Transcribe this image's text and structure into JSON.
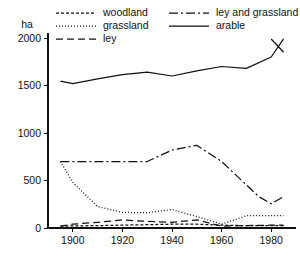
{
  "chart_data": {
    "type": "line",
    "title": "",
    "xlabel": "",
    "ylabel": "ha",
    "unit_label": "ha",
    "xlim": [
      1890,
      1990
    ],
    "ylim": [
      0,
      2100
    ],
    "yticks": [
      0,
      500,
      1000,
      1500,
      2000
    ],
    "xticks": [
      1900,
      1920,
      1940,
      1960,
      1980
    ],
    "grid": false,
    "legend_position": "top",
    "colors": {
      "line": "#111111",
      "background": "#ffffff"
    },
    "series": [
      {
        "name": "woodland",
        "dash": "3,2",
        "x": [
          1895,
          1910,
          1920,
          1930,
          1940,
          1950,
          1960,
          1970,
          1980,
          1985
        ],
        "values": [
          20,
          25,
          30,
          35,
          40,
          40,
          30,
          25,
          25,
          25
        ]
      },
      {
        "name": "grassland",
        "dash": "1,2",
        "x": [
          1895,
          1900,
          1910,
          1920,
          1930,
          1940,
          1950,
          1960,
          1970,
          1980,
          1985
        ],
        "values": [
          700,
          480,
          225,
          165,
          160,
          195,
          120,
          40,
          130,
          130,
          130
        ]
      },
      {
        "name": "ley",
        "dash": "7,4",
        "x": [
          1895,
          1900,
          1910,
          1920,
          1930,
          1940,
          1950,
          1960,
          1970,
          1980,
          1985
        ],
        "values": [
          20,
          40,
          60,
          85,
          70,
          60,
          85,
          20,
          25,
          30,
          30
        ]
      },
      {
        "name": "ley and grassland",
        "dash": "9,3,2,3",
        "x": [
          1895,
          1910,
          1920,
          1930,
          1940,
          1950,
          1960,
          1975,
          1980,
          1985
        ],
        "values": [
          700,
          700,
          700,
          700,
          820,
          870,
          700,
          330,
          255,
          330
        ]
      },
      {
        "name": "arable",
        "dash": "none",
        "x": [
          1895,
          1900,
          1910,
          1920,
          1930,
          1940,
          1950,
          1960,
          1970,
          1980,
          1985
        ],
        "values": [
          1545,
          1520,
          1570,
          1615,
          1640,
          1600,
          1655,
          1700,
          1680,
          1800,
          1990
        ]
      }
    ],
    "arable_tail": {
      "x": [
        1980,
        1985
      ],
      "values": [
        1990,
        1850
      ]
    }
  },
  "legend": {
    "items": [
      {
        "label": "woodland",
        "dash": "3,2"
      },
      {
        "label": "grassland",
        "dash": "1,2"
      },
      {
        "label": "ley",
        "dash": "7,4"
      },
      {
        "label": "ley and grassland",
        "dash": "9,3,2,3"
      },
      {
        "label": "arable",
        "dash": "none"
      }
    ]
  }
}
